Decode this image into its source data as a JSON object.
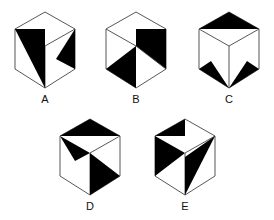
{
  "figures": [
    {
      "id": "A",
      "label": "A"
    },
    {
      "id": "B",
      "label": "B"
    },
    {
      "id": "C",
      "label": "C"
    },
    {
      "id": "D",
      "label": "D"
    },
    {
      "id": "E",
      "label": "E"
    }
  ],
  "colors": {
    "stroke": "#333333",
    "fill": "#000000",
    "background": "#ffffff"
  }
}
